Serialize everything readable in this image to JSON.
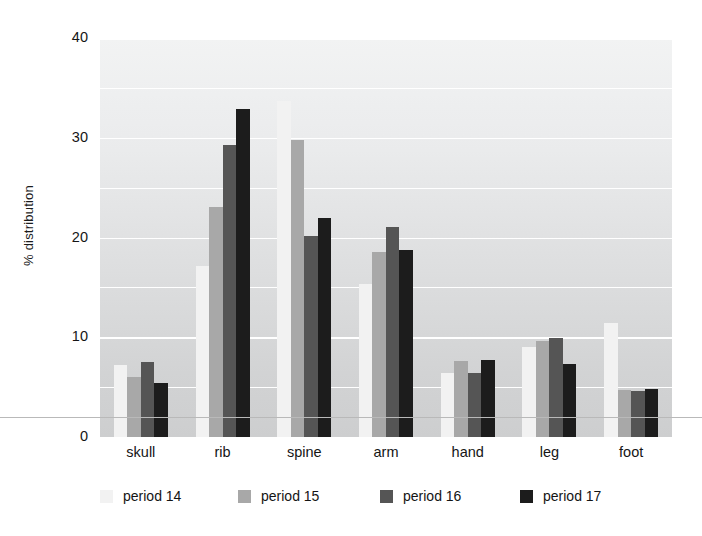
{
  "chart_data": {
    "type": "bar",
    "title": "",
    "xlabel": "",
    "ylabel": "% distribution",
    "ylim": [
      0,
      40
    ],
    "yticks": [
      0,
      10,
      20,
      30,
      40
    ],
    "ytick_labels": [
      "0",
      "10",
      "20",
      "30",
      "40"
    ],
    "minor_gridlines": [
      5,
      15,
      25,
      35
    ],
    "grid": true,
    "legend_position": "bottom",
    "categories": [
      "skull",
      "rib",
      "spine",
      "arm",
      "hand",
      "leg",
      "foot"
    ],
    "series": [
      {
        "name": "period 14",
        "color": "#f2f2f2",
        "values": [
          7.2,
          17.1,
          33.7,
          15.3,
          6.4,
          9.0,
          11.4
        ]
      },
      {
        "name": "period 15",
        "color": "#a8a8a8",
        "values": [
          6.0,
          23.1,
          29.8,
          18.5,
          7.6,
          9.6,
          4.7
        ]
      },
      {
        "name": "period 16",
        "color": "#555555",
        "values": [
          7.5,
          29.3,
          20.2,
          21.1,
          6.4,
          9.9,
          4.6
        ]
      },
      {
        "name": "period 17",
        "color": "#1c1c1c",
        "values": [
          5.4,
          32.9,
          22.0,
          18.7,
          7.7,
          7.3,
          4.8
        ]
      }
    ]
  },
  "axis": {
    "y_title": "% distribution",
    "y_tick_0": "0",
    "y_tick_10": "10",
    "y_tick_20": "20",
    "y_tick_30": "30",
    "y_tick_40": "40"
  },
  "x_labels": {
    "c0": "skull",
    "c1": "rib",
    "c2": "spine",
    "c3": "arm",
    "c4": "hand",
    "c5": "leg",
    "c6": "foot"
  },
  "legend": {
    "items": [
      {
        "label": "period 14",
        "color": "#f2f2f2"
      },
      {
        "label": "period 15",
        "color": "#a8a8a8"
      },
      {
        "label": "period 16",
        "color": "#555555"
      },
      {
        "label": "period 17",
        "color": "#1c1c1c"
      }
    ]
  },
  "colors": {
    "plot_background_top": "#f2f3f3",
    "plot_background_bottom": "#cdcecf",
    "gridline": "#ffffff",
    "page_rule": "#b9b9b9",
    "text": "#151515"
  }
}
